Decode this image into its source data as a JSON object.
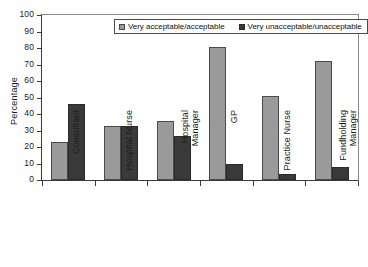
{
  "chart_data": {
    "type": "bar",
    "title": "",
    "xlabel": "",
    "ylabel": "Percentage",
    "ylim": [
      0,
      100
    ],
    "yticks": [
      0,
      10,
      20,
      30,
      40,
      50,
      60,
      70,
      80,
      90,
      100
    ],
    "grid": false,
    "legend_position": "top-center",
    "categories": [
      "Consultant",
      "Hospital Nurse",
      "Hospital Manager",
      "GP",
      "Practice Nurse",
      "Fundholding Manager"
    ],
    "category_lines": [
      [
        "Consultant"
      ],
      [
        "Hospital Nurse"
      ],
      [
        "Hospital",
        "Manager"
      ],
      [
        "GP"
      ],
      [
        "Practice Nurse"
      ],
      [
        "Fundholding",
        "Manager"
      ]
    ],
    "series": [
      {
        "name": "Very acceptable/acceptable",
        "color": "#9a9a9a",
        "values": [
          23,
          32.5,
          36,
          80.5,
          51,
          72
        ]
      },
      {
        "name": "Very unacceptable/unacceptable",
        "color": "#3a3a3a",
        "values": [
          46,
          32.5,
          26.5,
          9.5,
          3.5,
          8
        ]
      }
    ]
  },
  "legend": {
    "items": [
      {
        "label": "Very acceptable/acceptable"
      },
      {
        "label": "Very unacceptable/unacceptable"
      }
    ]
  }
}
